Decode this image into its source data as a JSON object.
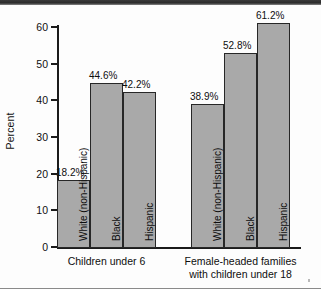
{
  "chart_data": {
    "type": "bar",
    "title": "",
    "subtitle": "",
    "xlabel": "",
    "ylabel": "Percent",
    "ylim": [
      0,
      60
    ],
    "yticks": [
      0,
      10,
      20,
      30,
      40,
      50,
      60
    ],
    "ytick_labels": [
      "0",
      "10",
      "20",
      "30",
      "40",
      "50",
      "60"
    ],
    "grid": false,
    "legend": "none",
    "value_label_suffix": "%",
    "groups": [
      {
        "name": "Children under 6",
        "caption": "Children under 6",
        "bars": [
          {
            "category": "White (non-Hispanic)",
            "value": 18.2,
            "label": "18.2%"
          },
          {
            "category": "Black",
            "value": 44.6,
            "label": "44.6%"
          },
          {
            "category": "Hispanic",
            "value": 42.2,
            "label": "42.2%"
          }
        ]
      },
      {
        "name": "Female-headed families with children under 18",
        "caption": "Female-headed families\nwith children under 18",
        "bars": [
          {
            "category": "White (non-Hispanic)",
            "value": 38.9,
            "label": "38.9%"
          },
          {
            "category": "Black",
            "value": 52.8,
            "label": "52.8%"
          },
          {
            "category": "Hispanic",
            "value": 61.2,
            "label": "61.2%"
          }
        ]
      }
    ],
    "categories": [
      "White (non-Hispanic)",
      "Black",
      "Hispanic"
    ],
    "series": [
      {
        "name": "Children under 6",
        "values": [
          18.2,
          44.6,
          42.2
        ]
      },
      {
        "name": "Female-headed families with children under 18",
        "values": [
          38.9,
          52.8,
          61.2
        ]
      }
    ],
    "colors": {
      "bar_fill": "#a9a9a9",
      "bar_border": "#272727",
      "axis": "#1b1b1b",
      "text": "#0e0e0e",
      "background": "#fdfdfd"
    }
  }
}
